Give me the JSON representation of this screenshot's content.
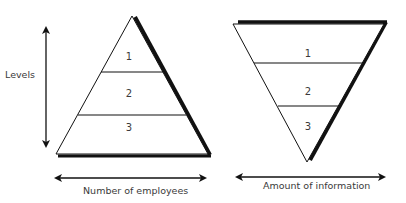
{
  "diagram": {
    "left_pyramid": {
      "type": "upright-pyramid",
      "levels": [
        "1",
        "2",
        "3"
      ],
      "vertical_axis_label": "Levels",
      "horizontal_axis_label": "Number of employees"
    },
    "right_pyramid": {
      "type": "inverted-pyramid",
      "levels": [
        "1",
        "2",
        "3"
      ],
      "horizontal_axis_label": "Amount of information"
    },
    "colors": {
      "stroke": "#111111",
      "text": "#3a3a3a",
      "background": "#ffffff"
    }
  }
}
